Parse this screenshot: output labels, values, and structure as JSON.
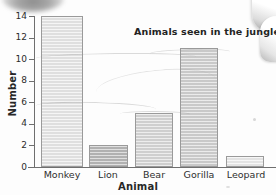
{
  "chart_data": {
    "type": "bar",
    "title": "Animals seen in the jungle",
    "xlabel": "Animal",
    "ylabel": "Number",
    "categories": [
      "Monkey",
      "Lion",
      "Bear",
      "Gorilla",
      "Leopard"
    ],
    "values": [
      14,
      2,
      5,
      11,
      1
    ],
    "ylim": [
      0,
      14
    ],
    "yticks": [
      "0",
      "2",
      "4",
      "6",
      "8",
      "10",
      "12",
      "14"
    ],
    "ytick_values": [
      0,
      2,
      4,
      6,
      8,
      10,
      12,
      14
    ],
    "grid": false,
    "legend": false,
    "bar_colors": [
      "#e9e9e9",
      "#b9b9b9",
      "#d8d8d8",
      "#d2d2d2",
      "#ededed"
    ],
    "bar_border_color": "#9a9a9a",
    "axis_color": "#6f6f6f",
    "text_color": "#272727",
    "background": "#fdfdfd"
  },
  "artifacts": {
    "smudge_top_left": "scan-smudge",
    "page_edge_right": "curled-page-corner"
  }
}
